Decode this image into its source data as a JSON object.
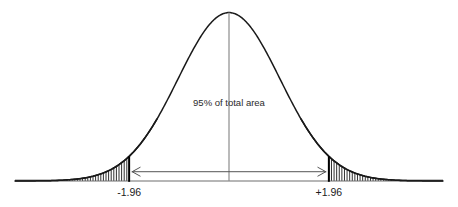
{
  "figure": {
    "background_color": "#ffffff",
    "curve_color": "#1a1a1a",
    "center_line_color": "#8c8c8c",
    "boundary_line_color": "#000000",
    "arrow_color": "#555555",
    "hatch_color": "#1a1a1a",
    "baseline_color": "#6e6e6e"
  },
  "annotations": {
    "area_label": "95% of total area",
    "left_tick_label": "-1.96",
    "right_tick_label": "+1.96"
  },
  "chart_data": {
    "type": "line",
    "subtype": "normal-distribution-density",
    "title": "",
    "subtitle": "",
    "xlabel": "",
    "ylabel": "",
    "grid": false,
    "legend_position": "none",
    "xlim": [
      -4.2,
      4.2
    ],
    "ylim": [
      0,
      0.42
    ],
    "distribution": {
      "name": "standard normal",
      "mean": 0,
      "standard_deviation": 1,
      "peak_density": 0.3989
    },
    "annotations": [
      {
        "text": "95% of total area",
        "x": 0,
        "y": 0.185,
        "type": "text-label"
      },
      {
        "text": "-1.96",
        "x": -1.96,
        "y": 0,
        "type": "axis-tick-label"
      },
      {
        "text": "+1.96",
        "x": 1.96,
        "y": 0,
        "type": "axis-tick-label"
      }
    ],
    "regions": [
      {
        "name": "central-area",
        "from": -1.96,
        "to": 1.96,
        "area_percent": 95,
        "shading": "none"
      },
      {
        "name": "left-tail",
        "from": -4.2,
        "to": -1.96,
        "area_percent": 2.5,
        "shading": "vertical-hatch"
      },
      {
        "name": "right-tail",
        "from": 1.96,
        "to": 4.2,
        "area_percent": 2.5,
        "shading": "vertical-hatch"
      }
    ],
    "markers": [
      {
        "name": "center-line",
        "x": 0,
        "from_y": 0,
        "to_y": 0.3989
      },
      {
        "name": "left-critical-value",
        "x": -1.96,
        "from_y": 0,
        "to_y": 0.0584
      },
      {
        "name": "right-critical-value",
        "x": 1.96,
        "from_y": 0,
        "to_y": 0.0584
      }
    ],
    "double_arrow": {
      "name": "confidence-interval-span",
      "from_x": -1.96,
      "to_x": 1.96,
      "y": 0.022,
      "heads": "both"
    },
    "x": [
      -4.2,
      -4.0,
      -3.8,
      -3.6,
      -3.4,
      -3.2,
      -3.0,
      -2.8,
      -2.6,
      -2.4,
      -2.2,
      -2.0,
      -1.96,
      -1.8,
      -1.6,
      -1.4,
      -1.2,
      -1.0,
      -0.8,
      -0.6,
      -0.4,
      -0.2,
      0.0,
      0.2,
      0.4,
      0.6,
      0.8,
      1.0,
      1.2,
      1.4,
      1.6,
      1.8,
      1.96,
      2.0,
      2.2,
      2.4,
      2.6,
      2.8,
      3.0,
      3.2,
      3.4,
      3.6,
      3.8,
      4.0,
      4.2
    ],
    "y": [
      0.0001,
      0.0001,
      0.0003,
      0.0006,
      0.0012,
      0.0024,
      0.0044,
      0.0079,
      0.0136,
      0.0224,
      0.0355,
      0.054,
      0.0584,
      0.079,
      0.1109,
      0.1497,
      0.1942,
      0.242,
      0.2897,
      0.3332,
      0.3683,
      0.391,
      0.3989,
      0.391,
      0.3683,
      0.3332,
      0.2897,
      0.242,
      0.1942,
      0.1497,
      0.1109,
      0.079,
      0.0584,
      0.054,
      0.0355,
      0.0224,
      0.0136,
      0.0079,
      0.0044,
      0.0024,
      0.0012,
      0.0006,
      0.0003,
      0.0001,
      0.0001
    ]
  }
}
